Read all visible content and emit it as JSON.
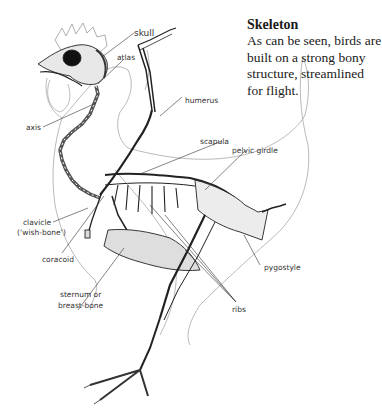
{
  "caption": {
    "title": "Skeleton",
    "body": "As can be seen, birds are built on a strong bony structure, streamlined for flight."
  },
  "labels": {
    "skull": "skull",
    "atlas": "atlas",
    "axis": "axis",
    "humerus": "humerus",
    "scapula": "scapula",
    "pelvic_girdle": "pelvic girdle",
    "clavicle_line1": "clavicle",
    "clavicle_line2": "(‘wish-bone’)",
    "coracoid": "coracoid",
    "sternum_line1": "sternum or",
    "sternum_line2": "breast-bone",
    "pygostyle": "pygostyle",
    "ribs": "ribs"
  },
  "colors": {
    "ink": "#222222",
    "outline": "#9a9a9a",
    "stipple": "#555555"
  }
}
